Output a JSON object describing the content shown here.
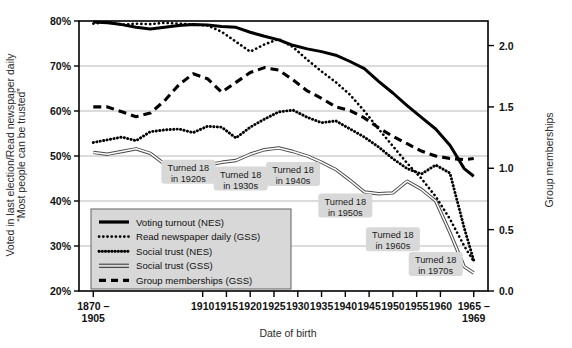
{
  "chart_data": {
    "type": "line",
    "title": "",
    "xlabel": "Date of birth",
    "ylabel_left": "Voted in last election/Read newspaper daily/“Most people can be trusted”",
    "ylabel_right": "Group memberships",
    "grid": true,
    "legend_position": "inside-lower-left",
    "x_categories": [
      "1870–1905",
      "1910",
      "1915",
      "1920",
      "1925",
      "1930",
      "1935",
      "1940",
      "1945",
      "1950",
      "1955",
      "1960",
      "1965–1969"
    ],
    "x_tick_labels": [
      "1870 –",
      "1910",
      "1915",
      "1920",
      "1925",
      "1930",
      "1935",
      "1940",
      "1945",
      "1950",
      "1955",
      "1960",
      "1965 –"
    ],
    "x_tick_labels_second_line": [
      "1905",
      "",
      "",
      "",
      "",
      "",
      "",
      "",
      "",
      "",
      "",
      "",
      "1969"
    ],
    "ylim_left": [
      20,
      80
    ],
    "y_ticks_left": [
      "20%",
      "30%",
      "40%",
      "50%",
      "60%",
      "70%",
      "80%"
    ],
    "ylim_right": [
      0.0,
      2.2
    ],
    "y_ticks_right": [
      "0.0",
      "0.5",
      "1.0",
      "1.5",
      "2.0"
    ],
    "x_numeric": [
      1887,
      1910,
      1915,
      1920,
      1925,
      1930,
      1935,
      1940,
      1945,
      1950,
      1955,
      1960,
      1967
    ],
    "series": [
      {
        "name": "Voting turnout (NES)",
        "axis": "left",
        "style": "solid-thick",
        "color": "#000000",
        "x": [
          1887,
          1890,
          1893,
          1896,
          1899,
          1902,
          1905,
          1908,
          1911,
          1914,
          1917,
          1920,
          1923,
          1926,
          1929,
          1932,
          1935,
          1938,
          1941,
          1944,
          1947,
          1950,
          1953,
          1956,
          1959,
          1962,
          1965,
          1967
        ],
        "values": [
          79.8,
          79.6,
          79.2,
          78.6,
          78.2,
          78.6,
          79.0,
          79.2,
          79.1,
          78.8,
          78.6,
          77.5,
          76.6,
          75.8,
          74.6,
          73.8,
          73.2,
          72.4,
          71.0,
          69.4,
          66.6,
          64.0,
          61.2,
          58.6,
          56.0,
          52.4,
          47.2,
          45.5
        ]
      },
      {
        "name": "Read newspaper daily (GSS)",
        "axis": "left",
        "style": "dotted-fine",
        "color": "#000000",
        "x": [
          1887,
          1890,
          1893,
          1896,
          1899,
          1902,
          1905,
          1908,
          1911,
          1914,
          1917,
          1920,
          1923,
          1926,
          1929,
          1932,
          1935,
          1938,
          1941,
          1944,
          1947,
          1950,
          1953,
          1956,
          1959,
          1962,
          1965,
          1967
        ],
        "values": [
          79.4,
          79.8,
          79.2,
          79.4,
          79.3,
          79.6,
          79.4,
          79.2,
          79.0,
          77.6,
          75.4,
          73.2,
          74.8,
          76.0,
          74.2,
          71.4,
          68.8,
          66.4,
          63.6,
          60.0,
          56.0,
          52.2,
          48.4,
          45.0,
          41.0,
          36.0,
          30.0,
          26.6
        ]
      },
      {
        "name": "Social trust (NES)",
        "axis": "left",
        "style": "dotted-bold",
        "color": "#000000",
        "x": [
          1887,
          1890,
          1893,
          1896,
          1899,
          1902,
          1905,
          1908,
          1911,
          1914,
          1917,
          1920,
          1923,
          1926,
          1929,
          1932,
          1935,
          1938,
          1941,
          1944,
          1947,
          1950,
          1953,
          1956,
          1959,
          1962,
          1965,
          1967
        ],
        "values": [
          53.0,
          53.6,
          54.2,
          53.4,
          55.4,
          55.8,
          56.0,
          55.2,
          56.6,
          56.4,
          54.0,
          56.4,
          58.2,
          59.8,
          60.2,
          58.6,
          57.4,
          57.8,
          56.0,
          54.2,
          52.0,
          49.4,
          47.2,
          46.0,
          48.0,
          46.2,
          34.0,
          26.8
        ]
      },
      {
        "name": "Social trust (GSS)",
        "axis": "left",
        "style": "solid-thin-double",
        "color": "#4a4a4a",
        "x": [
          1887,
          1890,
          1893,
          1896,
          1899,
          1902,
          1905,
          1908,
          1911,
          1914,
          1917,
          1920,
          1923,
          1926,
          1929,
          1932,
          1935,
          1938,
          1941,
          1944,
          1947,
          1950,
          1953,
          1956,
          1959,
          1962,
          1965,
          1967
        ],
        "values": [
          50.8,
          50.4,
          51.0,
          51.6,
          50.6,
          48.2,
          47.8,
          48.4,
          48.0,
          48.6,
          49.0,
          50.4,
          51.4,
          51.8,
          51.0,
          50.0,
          48.6,
          47.0,
          44.6,
          42.0,
          41.6,
          41.8,
          44.4,
          42.6,
          40.0,
          33.0,
          25.4,
          24.0
        ]
      },
      {
        "name": "Group memberships (GSS)",
        "axis": "right",
        "style": "dashed-bold",
        "color": "#000000",
        "x": [
          1887,
          1890,
          1893,
          1896,
          1899,
          1902,
          1905,
          1908,
          1911,
          1914,
          1917,
          1920,
          1923,
          1926,
          1929,
          1932,
          1935,
          1938,
          1941,
          1944,
          1947,
          1950,
          1953,
          1956,
          1959,
          1962,
          1965,
          1967
        ],
        "values": [
          1.5,
          1.5,
          1.46,
          1.42,
          1.45,
          1.55,
          1.68,
          1.77,
          1.73,
          1.62,
          1.7,
          1.78,
          1.82,
          1.8,
          1.72,
          1.63,
          1.57,
          1.5,
          1.47,
          1.41,
          1.33,
          1.26,
          1.2,
          1.14,
          1.1,
          1.08,
          1.07,
          1.08
        ]
      }
    ],
    "annotations": [
      {
        "label_line1": "Turned 18",
        "label_line2": "in 1920s",
        "x": 1907,
        "y_pct": 46.5
      },
      {
        "label_line1": "Turned 18",
        "label_line2": "in 1930s",
        "x": 1918,
        "y_pct": 45.0
      },
      {
        "label_line1": "Turned 18",
        "label_line2": "in 1940s",
        "x": 1929,
        "y_pct": 46.0
      },
      {
        "label_line1": "Turned 18",
        "label_line2": "in 1950s",
        "x": 1940,
        "y_pct": 39.0
      },
      {
        "label_line1": "Turned 18",
        "label_line2": "in 1960s",
        "x": 1950,
        "y_pct": 31.5
      },
      {
        "label_line1": "Turned 18",
        "label_line2": "in 1970s",
        "x": 1959,
        "y_pct": 26.0
      }
    ]
  },
  "colors": {
    "plot_border": "#000000",
    "gridline": "#b0b0b0",
    "annotation_bg": "#d8d8d8",
    "legend_bg": "#d8d8d8",
    "legend_border": "#6e6e6e",
    "text": "#111111",
    "axis_title": "#2b2b2b",
    "trust_gss_line": "#4a4a4a"
  },
  "legend": {
    "items": [
      {
        "label": "Voting turnout (NES)",
        "swatch": "solid-thick"
      },
      {
        "label": "Read newspaper daily (GSS)",
        "swatch": "dotted-fine"
      },
      {
        "label": "Social trust (NES)",
        "swatch": "dotted-bold"
      },
      {
        "label": "Social trust (GSS)",
        "swatch": "solid-thin-double"
      },
      {
        "label": "Group memberships (GSS)",
        "swatch": "dashed-bold"
      }
    ]
  }
}
